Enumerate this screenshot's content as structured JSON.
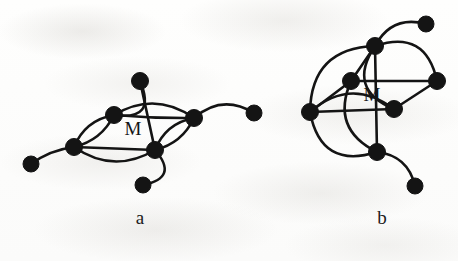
{
  "figure": {
    "width": 458,
    "height": 261,
    "background_color": "#fdfdfc",
    "ink_color": "#141414"
  },
  "panels": [
    {
      "id": "panel-a",
      "label": "a",
      "label_x": 140,
      "label_y": 207,
      "center_label": "M",
      "center_label_x": 133,
      "center_label_y": 118,
      "nodes": [
        {
          "id": "a1",
          "name": "top-node",
          "x": 140,
          "y": 81,
          "r": 8.5
        },
        {
          "id": "a2",
          "name": "upper-left-hub",
          "x": 114,
          "y": 115,
          "r": 8.5
        },
        {
          "id": "a3",
          "name": "left-hub",
          "x": 74,
          "y": 147,
          "r": 8.5
        },
        {
          "id": "a4",
          "name": "right-hub",
          "x": 194,
          "y": 118,
          "r": 8.5
        },
        {
          "id": "a5",
          "name": "lower-right-hub",
          "x": 155,
          "y": 150,
          "r": 8.5
        },
        {
          "id": "a6",
          "name": "bottom-pendant",
          "x": 143,
          "y": 185,
          "r": 8.0
        },
        {
          "id": "a7",
          "name": "left-pendant",
          "x": 31,
          "y": 164,
          "r": 8.0
        },
        {
          "id": "a8",
          "name": "right-pendant",
          "x": 254,
          "y": 113,
          "r": 8.0
        }
      ],
      "edges": [
        {
          "name": "top-to-lower-right-vertical",
          "from": "a1",
          "to": "a5",
          "bow": 0
        },
        {
          "name": "top-to-upper-left-arc",
          "from": "a1",
          "to": "a2",
          "bow": -19
        },
        {
          "name": "upper-left-to-left-upper",
          "from": "a2",
          "to": "a3",
          "bow": 7
        },
        {
          "name": "upper-left-to-left-lower",
          "from": "a2",
          "to": "a3",
          "bow": -6
        },
        {
          "name": "upper-left-to-right-arc",
          "from": "a2",
          "to": "a4",
          "bow": -13
        },
        {
          "name": "upper-left-to-right-straight",
          "from": "a2",
          "to": "a4",
          "bow": 1
        },
        {
          "name": "left-to-lower-right-straight",
          "from": "a3",
          "to": "a5",
          "bow": 0
        },
        {
          "name": "left-to-lower-right-arc",
          "from": "a3",
          "to": "a5",
          "bow": 13
        },
        {
          "name": "lower-right-to-right-upper",
          "from": "a5",
          "to": "a4",
          "bow": 6
        },
        {
          "name": "lower-right-to-right-lower",
          "from": "a5",
          "to": "a4",
          "bow": -7
        },
        {
          "name": "lower-right-to-bottom-arc",
          "from": "a5",
          "to": "a6",
          "bow": -16
        },
        {
          "name": "left-to-left-pendant",
          "from": "a3",
          "to": "a7",
          "bow": 3
        },
        {
          "name": "right-to-right-pendant",
          "from": "a4",
          "to": "a8",
          "bow": -11
        }
      ]
    },
    {
      "id": "panel-b",
      "label": "b",
      "label_x": 382,
      "label_y": 207,
      "center_label": "M",
      "center_label_x": 372,
      "center_label_y": 84,
      "nodes": [
        {
          "id": "b1",
          "name": "top-node",
          "x": 375,
          "y": 46,
          "r": 8.5
        },
        {
          "id": "b2",
          "name": "inner-upper-node",
          "x": 351,
          "y": 81,
          "r": 8.5
        },
        {
          "id": "b3",
          "name": "left-hub",
          "x": 310,
          "y": 112,
          "r": 8.5
        },
        {
          "id": "b4",
          "name": "right-node",
          "x": 437,
          "y": 81,
          "r": 8.5
        },
        {
          "id": "b5",
          "name": "inner-lower-node",
          "x": 394,
          "y": 109,
          "r": 8.5
        },
        {
          "id": "b6",
          "name": "bottom-node",
          "x": 377,
          "y": 152,
          "r": 8.5
        },
        {
          "id": "b7",
          "name": "upper-right-pendant",
          "x": 426,
          "y": 24,
          "r": 8.0
        },
        {
          "id": "b8",
          "name": "lower-right-pendant",
          "x": 415,
          "y": 186,
          "r": 8.0
        }
      ],
      "edges": [
        {
          "name": "top-to-bottom-vertical",
          "from": "b1",
          "to": "b6",
          "bow": 0
        },
        {
          "name": "top-to-left-outer-arc",
          "from": "b1",
          "to": "b3",
          "bow": 22
        },
        {
          "name": "top-to-inner-upper",
          "from": "b1",
          "to": "b2",
          "bow": 0
        },
        {
          "name": "top-to-right-arc",
          "from": "b1",
          "to": "b4",
          "bow": -20
        },
        {
          "name": "top-to-inner-lower-arc",
          "from": "b1",
          "to": "b5",
          "bow": 20
        },
        {
          "name": "inner-upper-to-left",
          "from": "b2",
          "to": "b3",
          "bow": 0
        },
        {
          "name": "inner-upper-to-right",
          "from": "b2",
          "to": "b4",
          "bow": 0
        },
        {
          "name": "inner-upper-to-bottom-arc",
          "from": "b2",
          "to": "b6",
          "bow": 18
        },
        {
          "name": "left-to-inner-lower",
          "from": "b3",
          "to": "b5",
          "bow": 0
        },
        {
          "name": "left-to-inner-lower-arc",
          "from": "b3",
          "to": "b5",
          "bow": -17
        },
        {
          "name": "left-to-bottom-outer-arc",
          "from": "b3",
          "to": "b6",
          "bow": 22
        },
        {
          "name": "inner-lower-to-right",
          "from": "b5",
          "to": "b4",
          "bow": 0
        },
        {
          "name": "top-to-upper-right-pendant",
          "from": "b1",
          "to": "b7",
          "bow": -11
        },
        {
          "name": "bottom-to-lower-right-pendant",
          "from": "b6",
          "to": "b8",
          "bow": -9
        }
      ]
    }
  ]
}
